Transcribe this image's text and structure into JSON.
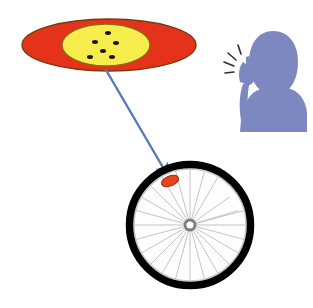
{
  "illustration": {
    "title": "Bicycle tyre puncture magnified with person snapping fingers",
    "background_color": "#ffffff",
    "width": 313,
    "height": 308
  },
  "magnifier": {
    "name": "magnified-view-ellipse",
    "outer": {
      "label": "outer-red-ellipse",
      "fill": "#E5331B",
      "stroke": "#7A3A10",
      "cx": 109,
      "cy": 45,
      "rx": 87,
      "ry": 26
    },
    "inner": {
      "label": "inner-yellow-ellipse",
      "fill": "#F6EC4B",
      "stroke": "#8A6A12",
      "cx": 106,
      "cy": 45,
      "rx": 44,
      "ry": 21
    },
    "particles": {
      "label": "black-particles",
      "color": "#1A1208",
      "count": 6,
      "points": [
        {
          "cx": 108,
          "cy": 33,
          "rx": 3.0,
          "ry": 1.9
        },
        {
          "cx": 95,
          "cy": 42,
          "rx": 3.0,
          "ry": 1.9
        },
        {
          "cx": 116,
          "cy": 43,
          "rx": 3.0,
          "ry": 1.9
        },
        {
          "cx": 103,
          "cy": 51,
          "rx": 3.0,
          "ry": 1.9
        },
        {
          "cx": 90,
          "cy": 57,
          "rx": 3.0,
          "ry": 1.9
        },
        {
          "cx": 112,
          "cy": 57,
          "rx": 3.0,
          "ry": 1.9
        }
      ]
    }
  },
  "pointer": {
    "name": "magnifier-pointer-arrow",
    "color": "#5A78B8",
    "start": {
      "x": 106,
      "y": 70
    },
    "end": {
      "x": 170,
      "y": 178
    },
    "width": 2.4,
    "arrowhead": "filled-triangle"
  },
  "wheel": {
    "name": "bicycle-wheel",
    "cx": 190,
    "cy": 225,
    "tire": {
      "label": "tire",
      "color": "#000000",
      "outer_radius": 64,
      "thickness": 7
    },
    "rim": {
      "label": "rim",
      "color": "#C9C9C9",
      "radius": 55
    },
    "interior_fill": "#FEFEFE",
    "hub": {
      "label": "hub",
      "outer_color": "#7C7C7C",
      "inner_color": "#FFFFFF",
      "outer_radius": 6.5,
      "inner_radius": 3.6
    },
    "spokes": {
      "label": "spokes",
      "color": "#BDBDBD",
      "count": 24
    },
    "puncture_marker": {
      "label": "puncture-spot",
      "fill": "#E5451C",
      "stroke": "#9A2A0C",
      "cx": 170,
      "cy": 181,
      "rx": 9,
      "ry": 5,
      "rotation": -22
    }
  },
  "person": {
    "name": "person-snapping-fingers-silhouette",
    "fill": "#7E88C0",
    "head": {
      "cx": 272,
      "cy": 62,
      "rx": 25,
      "ry": 31
    },
    "snap_lines": {
      "label": "finger-snap-motion-lines",
      "color": "#2B2B3C",
      "count": 4
    }
  }
}
